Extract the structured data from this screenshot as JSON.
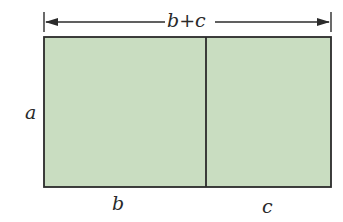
{
  "diagram": {
    "labels": {
      "top": "b+c",
      "left": "a",
      "bottom_left": "b",
      "bottom_right": "c"
    },
    "colors": {
      "fill": "#c9ddc1",
      "stroke": "#2b2b2b",
      "text": "#2a2a2a"
    },
    "rectangle": {
      "x": 44,
      "y": 37,
      "width": 287,
      "height": 150,
      "divider_x": 206
    }
  }
}
